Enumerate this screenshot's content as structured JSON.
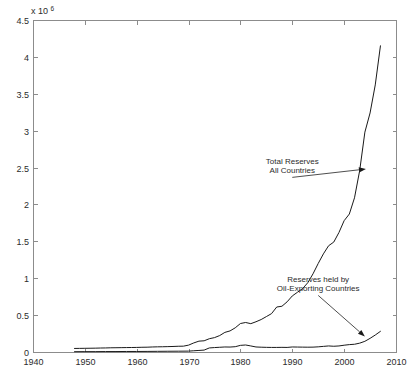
{
  "chart_data": {
    "type": "line",
    "title": "",
    "subtitle": "",
    "xlabel": "",
    "ylabel": "",
    "y_multiplier_prefix": "x 10",
    "y_multiplier_exponent": "6",
    "xlim": [
      1940,
      2010
    ],
    "ylim": [
      0,
      4.5
    ],
    "xticks": [
      1940,
      1950,
      1960,
      1970,
      1980,
      1990,
      2000,
      2010
    ],
    "xtick_labels": [
      "1940",
      "1950",
      "1960",
      "1970",
      "1980",
      "1990",
      "2000",
      "2010"
    ],
    "yticks": [
      0,
      0.5,
      1,
      1.5,
      2,
      2.5,
      3,
      3.5,
      4,
      4.5
    ],
    "ytick_labels": [
      "0",
      "0.5",
      "1",
      "1.5",
      "2",
      "2.5",
      "3",
      "3.5",
      "4",
      "4.5"
    ],
    "grid": false,
    "legend_position": "none",
    "box": true,
    "tick_direction": "in",
    "line_color": "#1a1a1a",
    "background_color": "#ffffff",
    "axis_color": "#8c8c8c",
    "series": [
      {
        "name": "Total Reserves All Countries",
        "x": [
          1948,
          1949,
          1950,
          1951,
          1952,
          1953,
          1954,
          1955,
          1956,
          1957,
          1958,
          1959,
          1960,
          1961,
          1962,
          1963,
          1964,
          1965,
          1966,
          1967,
          1968,
          1969,
          1970,
          1971,
          1972,
          1973,
          1974,
          1975,
          1976,
          1977,
          1978,
          1979,
          1980,
          1981,
          1982,
          1983,
          1984,
          1985,
          1986,
          1987,
          1988,
          1989,
          1990,
          1991,
          1992,
          1993,
          1994,
          1995,
          1996,
          1997,
          1998,
          1999,
          2000,
          2001,
          2002,
          2003,
          2004,
          2005,
          2006,
          2007
        ],
        "values": [
          0.048,
          0.049,
          0.05,
          0.051,
          0.052,
          0.054,
          0.055,
          0.057,
          0.058,
          0.059,
          0.06,
          0.061,
          0.062,
          0.064,
          0.065,
          0.068,
          0.07,
          0.071,
          0.073,
          0.075,
          0.078,
          0.079,
          0.093,
          0.123,
          0.147,
          0.152,
          0.18,
          0.195,
          0.223,
          0.266,
          0.286,
          0.328,
          0.386,
          0.4,
          0.384,
          0.41,
          0.44,
          0.48,
          0.52,
          0.61,
          0.62,
          0.68,
          0.76,
          0.81,
          0.86,
          0.94,
          1.06,
          1.2,
          1.33,
          1.44,
          1.49,
          1.62,
          1.78,
          1.87,
          2.09,
          2.46,
          2.98,
          3.24,
          3.62,
          4.15
        ]
      },
      {
        "name": "Reserves held by Oil-Exporting Countries",
        "x": [
          1948,
          1950,
          1952,
          1954,
          1956,
          1958,
          1960,
          1962,
          1964,
          1966,
          1968,
          1970,
          1971,
          1972,
          1973,
          1974,
          1975,
          1976,
          1977,
          1978,
          1979,
          1980,
          1981,
          1982,
          1983,
          1984,
          1985,
          1986,
          1987,
          1988,
          1989,
          1990,
          1991,
          1992,
          1993,
          1994,
          1995,
          1996,
          1997,
          1998,
          1999,
          2000,
          2001,
          2002,
          2003,
          2004,
          2005,
          2006,
          2007
        ],
        "values": [
          0.004,
          0.005,
          0.005,
          0.006,
          0.006,
          0.007,
          0.007,
          0.008,
          0.009,
          0.01,
          0.011,
          0.012,
          0.017,
          0.021,
          0.026,
          0.055,
          0.06,
          0.064,
          0.068,
          0.067,
          0.072,
          0.09,
          0.095,
          0.082,
          0.068,
          0.065,
          0.063,
          0.062,
          0.062,
          0.063,
          0.062,
          0.068,
          0.067,
          0.066,
          0.065,
          0.066,
          0.07,
          0.076,
          0.082,
          0.078,
          0.082,
          0.092,
          0.1,
          0.105,
          0.12,
          0.145,
          0.185,
          0.23,
          0.28
        ]
      }
    ],
    "annotations": [
      {
        "id": "total-reserves",
        "lines": [
          "Total Reserves",
          "All Countries"
        ],
        "text_x": 1990,
        "text_y": 2.55,
        "target_x": 2004.2,
        "target_y": 2.48
      },
      {
        "id": "oil-exporting",
        "lines": [
          "Reserves held by",
          "Oil-Exporting Countries"
        ],
        "text_x": 1995,
        "text_y": 0.95,
        "target_x": 2004.0,
        "target_y": 0.21
      }
    ]
  }
}
